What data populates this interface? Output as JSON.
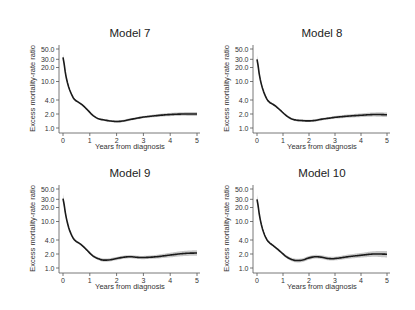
{
  "figure": {
    "layout": "2x2 grid",
    "background": "#ffffff",
    "line_color": "#1a1a1a",
    "band_color": "#9a9a9a"
  },
  "chart_data": [
    {
      "type": "line",
      "title": "Model 7",
      "xlabel": "Years from diagnosis",
      "ylabel": "Excess mortality-rate ratio",
      "yscale": "log",
      "xlim": [
        0,
        5
      ],
      "ylim": [
        1.0,
        50.0
      ],
      "xticks": [
        "0",
        "1",
        "2",
        "3",
        "4",
        "5"
      ],
      "yticks": [
        "1.0",
        "2.0",
        "4.0",
        "10.0",
        "20.0",
        "30.0",
        "50.0"
      ],
      "grid": false,
      "legend": null,
      "series": [
        {
          "name": "estimate with 95% CI band",
          "x": [
            0,
            0.1,
            0.2,
            0.3,
            0.4,
            0.5,
            0.7,
            0.9,
            1.1,
            1.3,
            1.5,
            1.75,
            2.0,
            2.25,
            2.5,
            2.75,
            3.0,
            3.5,
            4.0,
            4.5,
            5.0
          ],
          "values": [
            33,
            14,
            8.0,
            5.6,
            4.3,
            3.8,
            3.2,
            2.5,
            1.9,
            1.6,
            1.5,
            1.42,
            1.38,
            1.42,
            1.52,
            1.62,
            1.72,
            1.85,
            1.95,
            2.0,
            2.0
          ],
          "band_halfwidth_log": [
            0.08,
            0.03,
            0.02,
            0.02,
            0.02,
            0.02,
            0.02,
            0.02,
            0.02,
            0.02,
            0.02,
            0.02,
            0.025,
            0.025,
            0.025,
            0.025,
            0.025,
            0.03,
            0.035,
            0.04,
            0.045
          ]
        }
      ]
    },
    {
      "type": "line",
      "title": "Model 8",
      "xlabel": "Years from diagnosis",
      "ylabel": "Excess mortality-rate ratio",
      "yscale": "log",
      "xlim": [
        0,
        5
      ],
      "ylim": [
        1.0,
        50.0
      ],
      "xticks": [
        "0",
        "1",
        "2",
        "3",
        "4",
        "5"
      ],
      "yticks": [
        "1.0",
        "2.0",
        "4.0",
        "10.0",
        "20.0",
        "30.0",
        "50.0"
      ],
      "grid": false,
      "legend": null,
      "series": [
        {
          "name": "estimate with 95% CI band",
          "x": [
            0,
            0.1,
            0.2,
            0.3,
            0.4,
            0.5,
            0.7,
            0.9,
            1.1,
            1.3,
            1.5,
            1.75,
            2.0,
            2.25,
            2.5,
            2.75,
            3.0,
            3.5,
            4.0,
            4.5,
            5.0
          ],
          "values": [
            30,
            13,
            7.5,
            5.2,
            4.0,
            3.5,
            3.0,
            2.4,
            1.9,
            1.6,
            1.48,
            1.44,
            1.42,
            1.46,
            1.55,
            1.62,
            1.7,
            1.8,
            1.88,
            1.95,
            1.93
          ],
          "band_halfwidth_log": [
            0.09,
            0.03,
            0.02,
            0.02,
            0.02,
            0.02,
            0.02,
            0.02,
            0.02,
            0.025,
            0.025,
            0.025,
            0.025,
            0.025,
            0.025,
            0.025,
            0.03,
            0.035,
            0.04,
            0.045,
            0.05
          ]
        }
      ]
    },
    {
      "type": "line",
      "title": "Model 9",
      "xlabel": "Years from diagnosis",
      "ylabel": "Excess mortality-rate ratio",
      "yscale": "log",
      "xlim": [
        0,
        5
      ],
      "ylim": [
        1.0,
        50.0
      ],
      "xticks": [
        "0",
        "1",
        "2",
        "3",
        "4",
        "5"
      ],
      "yticks": [
        "1.0",
        "2.0",
        "4.0",
        "10.0",
        "20.0",
        "30.0",
        "50.0"
      ],
      "grid": false,
      "legend": null,
      "series": [
        {
          "name": "estimate with 95% CI band",
          "x": [
            0,
            0.1,
            0.2,
            0.3,
            0.4,
            0.5,
            0.7,
            0.9,
            1.1,
            1.3,
            1.5,
            1.75,
            2.0,
            2.25,
            2.5,
            2.75,
            3.0,
            3.5,
            4.0,
            4.5,
            5.0
          ],
          "values": [
            31,
            14,
            7.8,
            5.4,
            4.2,
            3.7,
            3.1,
            2.4,
            1.85,
            1.6,
            1.48,
            1.5,
            1.6,
            1.7,
            1.75,
            1.7,
            1.68,
            1.75,
            1.9,
            2.05,
            2.1
          ],
          "band_halfwidth_log": [
            0.1,
            0.03,
            0.02,
            0.02,
            0.02,
            0.02,
            0.02,
            0.02,
            0.025,
            0.03,
            0.035,
            0.035,
            0.035,
            0.035,
            0.035,
            0.035,
            0.035,
            0.04,
            0.05,
            0.055,
            0.06
          ]
        }
      ]
    },
    {
      "type": "line",
      "title": "Model 10",
      "xlabel": "Years from diagnosis",
      "ylabel": "Excess mortality-rate ratio",
      "yscale": "log",
      "xlim": [
        0,
        5
      ],
      "ylim": [
        1.0,
        50.0
      ],
      "xticks": [
        "0",
        "1",
        "2",
        "3",
        "4",
        "5"
      ],
      "yticks": [
        "1.0",
        "2.0",
        "4.0",
        "10.0",
        "20.0",
        "30.0",
        "50.0"
      ],
      "grid": false,
      "legend": null,
      "series": [
        {
          "name": "estimate with 95% CI band",
          "x": [
            0,
            0.1,
            0.2,
            0.3,
            0.4,
            0.5,
            0.7,
            0.9,
            1.1,
            1.3,
            1.5,
            1.75,
            2.0,
            2.25,
            2.5,
            2.75,
            3.0,
            3.5,
            4.0,
            4.5,
            5.0
          ],
          "values": [
            30,
            13,
            7.3,
            5.0,
            3.9,
            3.4,
            2.8,
            2.25,
            1.8,
            1.55,
            1.45,
            1.48,
            1.65,
            1.75,
            1.7,
            1.6,
            1.6,
            1.75,
            1.88,
            2.0,
            1.98
          ],
          "band_halfwidth_log": [
            0.1,
            0.03,
            0.02,
            0.02,
            0.02,
            0.02,
            0.02,
            0.025,
            0.03,
            0.035,
            0.04,
            0.04,
            0.04,
            0.04,
            0.04,
            0.04,
            0.04,
            0.045,
            0.05,
            0.06,
            0.07
          ]
        }
      ]
    }
  ],
  "panels_geometry": [
    {
      "axis_x": 59,
      "x0": 63,
      "x5": 197,
      "y_top": 49,
      "y_bottom": 128,
      "axis_y": 133,
      "title_x": 130,
      "title_y": 37,
      "xlabel_y": 149,
      "ylabel_x": 35
    },
    {
      "axis_x": 253,
      "x0": 257,
      "x5": 387,
      "y_top": 49,
      "y_bottom": 128,
      "axis_y": 133,
      "title_x": 322,
      "title_y": 37,
      "xlabel_y": 149,
      "ylabel_x": 19
    },
    {
      "axis_x": 59,
      "x0": 63,
      "x5": 197,
      "y_top": 189,
      "y_bottom": 268,
      "axis_y": 273,
      "title_x": 130,
      "title_y": 177,
      "xlabel_y": 289,
      "ylabel_x": 35
    },
    {
      "axis_x": 253,
      "x0": 257,
      "x5": 387,
      "y_top": 189,
      "y_bottom": 268,
      "axis_y": 273,
      "title_x": 322,
      "title_y": 177,
      "xlabel_y": 289,
      "ylabel_x": 19
    }
  ]
}
